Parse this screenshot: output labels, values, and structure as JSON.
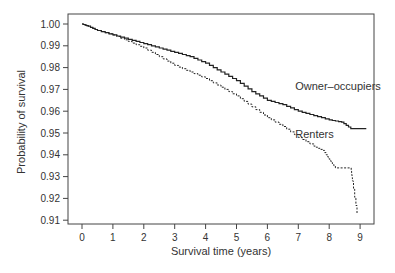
{
  "chart_data": {
    "type": "line",
    "title": "",
    "xlabel": "Survival time (years)",
    "ylabel": "Probability of survival",
    "xlim": [
      -0.45,
      9.45
    ],
    "ylim": [
      0.9095,
      1.0045
    ],
    "x_ticks": [
      0,
      1,
      2,
      3,
      4,
      5,
      6,
      7,
      8,
      9
    ],
    "y_ticks": [
      0.91,
      0.92,
      0.93,
      0.94,
      0.95,
      0.96,
      0.97,
      0.98,
      0.99,
      1.0
    ],
    "y_tick_labels": [
      "0.91",
      "0.92",
      "0.93",
      "0.94",
      "0.95",
      "0.96",
      "0.97",
      "0.98",
      "0.99",
      "1.00"
    ],
    "grid": false,
    "legend": "inline annotations",
    "series": [
      {
        "name": "Owner–occupiers",
        "style": "solid",
        "step": true,
        "x": [
          0,
          0.2,
          0.5,
          1.0,
          1.5,
          2.0,
          2.5,
          3.0,
          3.5,
          4.0,
          4.5,
          5.0,
          5.5,
          6.0,
          6.5,
          7.0,
          7.5,
          8.0,
          8.4,
          8.7,
          9.2
        ],
        "y": [
          1.0,
          0.999,
          0.997,
          0.995,
          0.993,
          0.991,
          0.989,
          0.987,
          0.985,
          0.982,
          0.978,
          0.974,
          0.969,
          0.965,
          0.963,
          0.96,
          0.958,
          0.956,
          0.955,
          0.952,
          0.952
        ]
      },
      {
        "name": "Renters",
        "style": "dashed",
        "step": true,
        "x": [
          0,
          0.2,
          0.5,
          1.0,
          1.5,
          2.0,
          2.5,
          3.0,
          3.5,
          4.0,
          4.5,
          5.0,
          5.5,
          6.0,
          6.5,
          7.0,
          7.5,
          7.8,
          8.0,
          8.2,
          8.7,
          8.75,
          8.9
        ],
        "y": [
          1.0,
          0.999,
          0.997,
          0.995,
          0.992,
          0.989,
          0.985,
          0.981,
          0.978,
          0.975,
          0.971,
          0.967,
          0.962,
          0.957,
          0.953,
          0.948,
          0.944,
          0.942,
          0.938,
          0.934,
          0.934,
          0.928,
          0.913
        ]
      }
    ],
    "annotations": [
      {
        "text": "Owner–occupiers",
        "x": 6.9,
        "y": 0.9695
      },
      {
        "text": "Renters",
        "x": 6.9,
        "y": 0.9475
      }
    ]
  },
  "labels": {
    "xlabel": "Survival time (years)",
    "ylabel": "Probability of survival",
    "owner": "Owner–occupiers",
    "renters": "Renters"
  }
}
